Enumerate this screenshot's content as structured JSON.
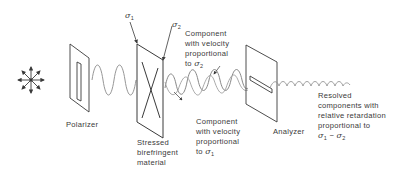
{
  "diagram": {
    "components": {
      "light_source": {
        "icon": "unpolarized-light-icon"
      },
      "polarizer": {
        "label": "Polarizer"
      },
      "stressed_material": {
        "label_lines": [
          "Stressed",
          "birefringent",
          "material"
        ]
      },
      "analyzer": {
        "label": "Analyzer"
      }
    },
    "stress_labels": {
      "sigma1": "σ",
      "sigma1_sub": "1",
      "sigma2": "σ",
      "sigma2_sub": "2"
    },
    "annotations": {
      "component_sigma2": {
        "lines": [
          "Component",
          "with velocity",
          "proportional"
        ],
        "last_prefix": "to ",
        "symbol": "σ",
        "sub": "2"
      },
      "component_sigma1": {
        "lines": [
          "Component",
          "with velocity",
          "proportional"
        ],
        "last_prefix": "to ",
        "symbol": "σ",
        "sub": "1"
      },
      "resolved": {
        "lines": [
          "Resolved",
          "components with",
          "relative retardation",
          "proportional to"
        ],
        "expr_sym1": "σ",
        "expr_sub1": "1",
        "expr_op": " − ",
        "expr_sym2": "σ",
        "expr_sub2": "2"
      }
    },
    "colors": {
      "line": "#3a3a3a",
      "wave": "#8a8a8a",
      "background": "#ffffff"
    }
  }
}
